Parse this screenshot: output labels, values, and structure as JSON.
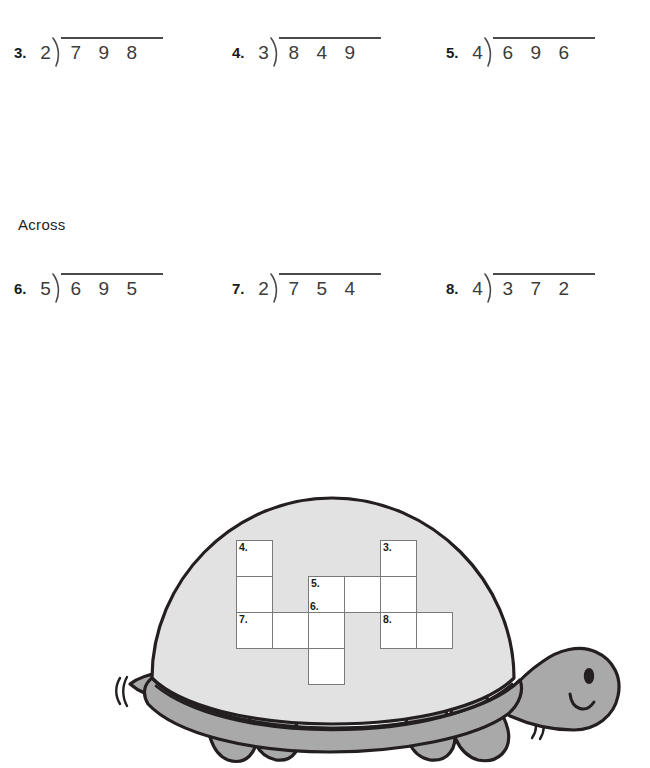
{
  "worksheet": {
    "section_label": "Across",
    "rows": [
      {
        "id": "row-down",
        "top": 30,
        "problems": [
          {
            "number": "3.",
            "divisor": "2",
            "dividend": [
              "7",
              "9",
              "8"
            ],
            "left": 14,
            "width": 200
          },
          {
            "number": "4.",
            "divisor": "3",
            "dividend": [
              "8",
              "4",
              "9"
            ],
            "left": 232,
            "width": 200
          },
          {
            "number": "5.",
            "divisor": "4",
            "dividend": [
              "6",
              "9",
              "6"
            ],
            "left": 446,
            "width": 200
          }
        ]
      },
      {
        "id": "row-across",
        "top": 266,
        "problems": [
          {
            "number": "6.",
            "divisor": "5",
            "dividend": [
              "6",
              "9",
              "5"
            ],
            "left": 14,
            "width": 200
          },
          {
            "number": "7.",
            "divisor": "2",
            "dividend": [
              "7",
              "5",
              "4"
            ],
            "left": 232,
            "width": 200
          },
          {
            "number": "8.",
            "divisor": "4",
            "dividend": [
              "3",
              "7",
              "2"
            ],
            "left": 446,
            "width": 200
          }
        ]
      }
    ],
    "section_label_pos": {
      "left": 18,
      "top": 216
    }
  },
  "crossword": {
    "cell_size": 37,
    "cells": [
      {
        "col": 0,
        "row": 0,
        "label": "4.",
        "label_pos": "top"
      },
      {
        "col": 0,
        "row": 1,
        "label": "",
        "label_pos": "top"
      },
      {
        "col": 0,
        "row": 2,
        "label": "7.",
        "label_pos": "top"
      },
      {
        "col": 1,
        "row": 2,
        "label": "",
        "label_pos": "top"
      },
      {
        "col": 2,
        "row": 1,
        "label": "5.",
        "label_pos": "top"
      },
      {
        "col": 2,
        "row": 2,
        "label": "",
        "label_pos": "top"
      },
      {
        "col": 2,
        "row": 3,
        "label": "",
        "label_pos": "top"
      },
      {
        "col": 3,
        "row": 1,
        "label": "",
        "label_pos": "top"
      },
      {
        "col": 4,
        "row": 0,
        "label": "3.",
        "label_pos": "top"
      },
      {
        "col": 4,
        "row": 1,
        "label": "",
        "label_pos": "top"
      },
      {
        "col": 4,
        "row": 2,
        "label": "8.",
        "label_pos": "top"
      },
      {
        "col": 5,
        "row": 2,
        "label": "",
        "label_pos": "top"
      }
    ],
    "extra_label": {
      "text": "6.",
      "col": 2,
      "row": 1,
      "position": "bottom"
    }
  },
  "illustration": {
    "name": "turtle",
    "shell_color": "#e2e2e2",
    "body_color": "#a9a9a9",
    "outline_color": "#231f20",
    "motion_lines": 2
  }
}
